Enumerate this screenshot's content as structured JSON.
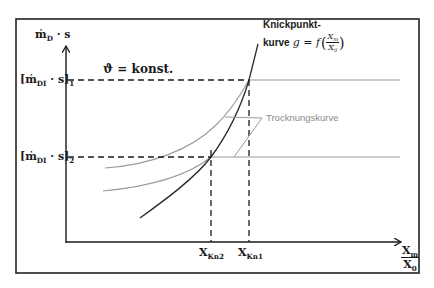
{
  "diagram": {
    "y_axis_label": "ṁ",
    "y_axis_label_sub": "D",
    "y_axis_label_rest": " · s",
    "constant_note": "ϑ = konst.",
    "level_1": {
      "prefix": "[ṁ",
      "sub": "DI",
      "mid": " · s]",
      "index": "1"
    },
    "level_2": {
      "prefix": "[ṁ",
      "sub": "DI",
      "mid": " · s]",
      "index": "2"
    },
    "x_axis_label_num": "X",
    "x_axis_label_num_sub": "m",
    "x_axis_label_den": "X",
    "x_axis_label_den_sub": "0",
    "x_tick_2": {
      "main": "X",
      "sub": "Kn2"
    },
    "x_tick_1": {
      "main": "X",
      "sub": "Kn1"
    },
    "knickpunkt_line1": "Knickpunkt-",
    "knickpunkt_line2": "kurve ",
    "knickpunkt_formula": "g = f",
    "knickpunkt_frac_num": "X",
    "knickpunkt_frac_num_sub": "m",
    "knickpunkt_frac_den": "X",
    "knickpunkt_frac_den_sub": "0",
    "trocknungskurve_label": "Trocknungskurve",
    "colors": {
      "ink": "#1a1a1a",
      "grey_curve": "#9a9a9a",
      "grey_label": "#8a8a8a",
      "frame": "#222222"
    }
  }
}
